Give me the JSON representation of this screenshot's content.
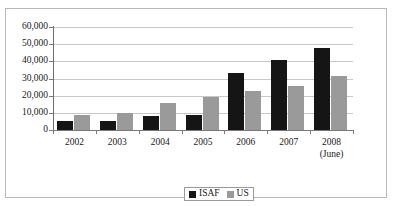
{
  "chart_data": {
    "type": "bar",
    "title": "",
    "subtitle": "",
    "xlabel": "",
    "ylabel": "",
    "categories": [
      "2002",
      "2003",
      "2004",
      "2005",
      "2006",
      "2007",
      "2008"
    ],
    "category_sublabels": [
      "",
      "",
      "",
      "",
      "",
      "",
      "(June)"
    ],
    "series": [
      {
        "name": "ISAF",
        "color": "#151515",
        "values": [
          5000,
          5200,
          8300,
          8900,
          33000,
          41000,
          48000
        ]
      },
      {
        "name": "US",
        "color": "#9a9a9a",
        "values": [
          9000,
          9800,
          16000,
          19500,
          23000,
          25500,
          31500
        ]
      }
    ],
    "ylim": [
      0,
      60000
    ],
    "ytick_values": [
      0,
      10000,
      20000,
      30000,
      40000,
      50000,
      60000
    ],
    "ytick_labels": [
      "0",
      "10,000",
      "20,000",
      "30,000",
      "40,000",
      "50,000",
      "60,000"
    ],
    "grid": true,
    "grid_axis": "y",
    "legend_position": "bottom-center",
    "legend_entries": [
      "ISAF",
      "US"
    ]
  }
}
